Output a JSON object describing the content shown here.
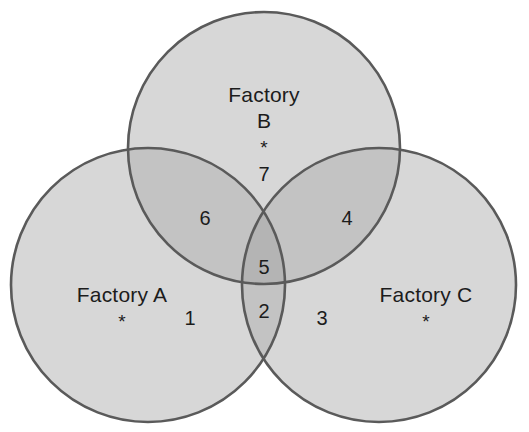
{
  "diagram": {
    "type": "venn-3-set",
    "title_visible": false,
    "background_color": "#ffffff",
    "circle_fill_color": "#d7d7d7",
    "circle_overlap_color": "#c3c3c3",
    "circle_triple_overlap_color": "#b4b4b4",
    "circle_stroke_color": "#5a5a5a",
    "text_color": "#1c1c1c",
    "circles": [
      {
        "id": "A",
        "label": "Factory A",
        "cx": 148,
        "cy": 285,
        "r": 137
      },
      {
        "id": "B",
        "label": "Factory B",
        "cx": 264,
        "cy": 148,
        "r": 136
      },
      {
        "id": "C",
        "label": "Factory C",
        "cx": 379,
        "cy": 285,
        "r": 137
      }
    ]
  },
  "sets": {
    "a": {
      "name": "Factory A",
      "marker": "*"
    },
    "b": {
      "name_line1": "Factory",
      "name_line2": "B",
      "marker": "*"
    },
    "c": {
      "name": "Factory C",
      "marker": "*"
    }
  },
  "regions": [
    {
      "id": "a-only",
      "label": "1",
      "sets": [
        "A"
      ]
    },
    {
      "id": "a-c-only",
      "label": "2",
      "sets": [
        "A",
        "C"
      ]
    },
    {
      "id": "c-only",
      "label": "3",
      "sets": [
        "C"
      ]
    },
    {
      "id": "b-c-only",
      "label": "4",
      "sets": [
        "B",
        "C"
      ]
    },
    {
      "id": "a-b-c",
      "label": "5",
      "sets": [
        "A",
        "B",
        "C"
      ]
    },
    {
      "id": "a-b-only",
      "label": "6",
      "sets": [
        "A",
        "B"
      ]
    },
    {
      "id": "b-only",
      "label": "7",
      "sets": [
        "B"
      ]
    }
  ],
  "chart_data": {
    "type": "venn",
    "title": "",
    "sets": [
      "Factory A",
      "Factory B",
      "Factory C"
    ],
    "region_labels": {
      "A": "1",
      "B": "7",
      "C": "3",
      "AB": "6",
      "AC": "2",
      "BC": "4",
      "ABC": "5"
    },
    "categories": [
      "A",
      "B",
      "C",
      "AB",
      "AC",
      "BC",
      "ABC"
    ],
    "values": [
      1,
      7,
      3,
      6,
      2,
      4,
      5
    ],
    "note": "Numbers are region identifiers/labels placed in each Venn region; asterisks mark each set's own area."
  }
}
